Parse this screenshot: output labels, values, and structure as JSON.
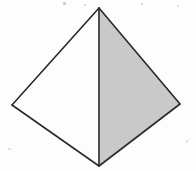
{
  "figure": {
    "title": "Triangular pyramid (tetrahedron) line drawing",
    "type": "geometric-solid",
    "solid_name": "triangular pyramid",
    "canvas": {
      "width": 196,
      "height": 171,
      "background": "#fdfdfd"
    },
    "style": {
      "stroke_color": "#2a2a2a",
      "stroke_width": 1.6,
      "shaded_face_fill": "#c9c9c9",
      "unshaded_face_fill": "#fdfdfd"
    },
    "vertices": [
      {
        "name": "apex",
        "label": "apex",
        "x": 99,
        "y": 8
      },
      {
        "name": "base-left",
        "label": "left base vertex",
        "x": 12,
        "y": 105
      },
      {
        "name": "base-right",
        "label": "right base vertex",
        "x": 180,
        "y": 104
      },
      {
        "name": "base-front",
        "label": "front base vertex",
        "x": 99,
        "y": 166
      }
    ],
    "faces": [
      {
        "name": "left-face",
        "label": "left visible face",
        "fill": "#fdfdfd",
        "shaded": false,
        "points": "99,8 12,105 99,166"
      },
      {
        "name": "right-face",
        "label": "right shaded face",
        "fill": "#c9c9c9",
        "shaded": true,
        "points": "99,8 180,104 99,166"
      }
    ],
    "edges": [
      {
        "name": "edge-apex-left",
        "label": "apex to left base vertex",
        "x1": 99,
        "y1": 8,
        "x2": 12,
        "y2": 105
      },
      {
        "name": "edge-apex-right",
        "label": "apex to right base vertex",
        "x1": 99,
        "y1": 8,
        "x2": 180,
        "y2": 104
      },
      {
        "name": "edge-apex-front",
        "label": "apex to front base vertex (vertical)",
        "x1": 99,
        "y1": 8,
        "x2": 99,
        "y2": 166
      },
      {
        "name": "edge-left-front",
        "label": "left base vertex to front base vertex",
        "x1": 12,
        "y1": 105,
        "x2": 99,
        "y2": 166
      },
      {
        "name": "edge-right-front",
        "label": "right base vertex to front base vertex",
        "x1": 180,
        "y1": 104,
        "x2": 99,
        "y2": 166
      }
    ],
    "artifacts": [
      {
        "name": "scan-speck-1",
        "x": 63,
        "y": 2,
        "width": 3,
        "height": 3,
        "color": "#cfcfcf"
      },
      {
        "name": "scan-speck-2",
        "x": 84,
        "y": 4,
        "width": 2,
        "height": 2,
        "color": "#dddddd"
      },
      {
        "name": "scan-speck-3",
        "x": 141,
        "y": 3,
        "width": 2,
        "height": 2,
        "color": "#dcdcdc"
      },
      {
        "name": "scan-speck-4",
        "x": 177,
        "y": 5,
        "width": 2,
        "height": 2,
        "color": "#e0e0e0"
      },
      {
        "name": "scan-speck-5",
        "x": 8,
        "y": 148,
        "width": 3,
        "height": 2,
        "color": "#e2e2e2"
      },
      {
        "name": "scan-speck-6",
        "x": 186,
        "y": 140,
        "width": 2,
        "height": 3,
        "color": "#e2e2e2"
      }
    ]
  }
}
